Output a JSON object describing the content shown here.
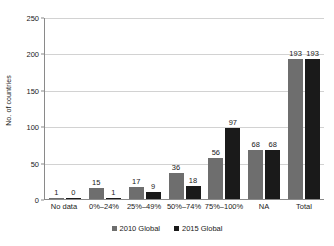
{
  "chart_data": {
    "type": "bar",
    "title": "",
    "xlabel": "",
    "ylabel": "No. of countries",
    "ylim": [
      0,
      250
    ],
    "yticks": [
      0,
      50,
      100,
      150,
      200,
      250
    ],
    "grid": true,
    "legend_position": "bottom-center",
    "categories": [
      "No data",
      "0%–24%",
      "25%–49%",
      "50%–74%",
      "75%–100%",
      "NA",
      "Total"
    ],
    "series": [
      {
        "name": "2010 Global",
        "color": "#6e6e6e",
        "values": [
          1,
          15,
          17,
          36,
          56,
          68,
          193
        ]
      },
      {
        "name": "2015 Global",
        "color": "#1a1a1a",
        "values": [
          0,
          1,
          9,
          18,
          97,
          68,
          193
        ]
      }
    ]
  },
  "axis": {
    "tick_labels": [
      "0",
      "50",
      "100",
      "150",
      "200",
      "250"
    ]
  },
  "legend": {
    "items": [
      {
        "label": "2010 Global"
      },
      {
        "label": "2015 Global"
      }
    ]
  }
}
